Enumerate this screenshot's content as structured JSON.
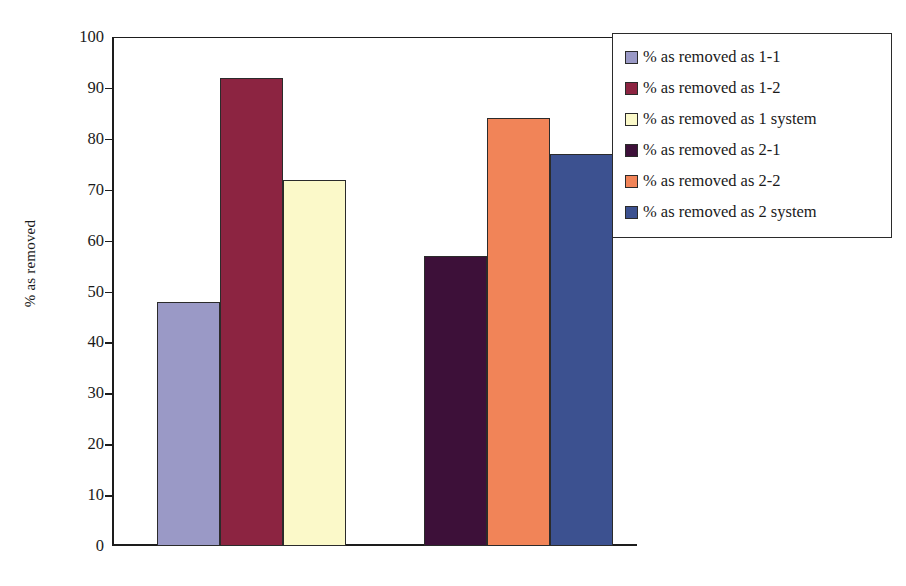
{
  "chart_data": {
    "type": "bar",
    "title": "",
    "xlabel": "",
    "ylabel": "% as removed",
    "ylim": [
      0,
      100
    ],
    "ytick_labels": [
      "100",
      "90",
      "80",
      "70",
      "60",
      "50",
      "40",
      "30",
      "20",
      "10",
      "0"
    ],
    "ytick_values": [
      100,
      90,
      80,
      70,
      60,
      50,
      40,
      30,
      20,
      10,
      0
    ],
    "grid": false,
    "legend_position": "right-top",
    "categories": [
      "System 1",
      "System 2"
    ],
    "series": [
      {
        "name": "% as removed as 1-1",
        "value": 48,
        "color": "#9a99c6",
        "group": 0
      },
      {
        "name": "% as removed as 1-2",
        "value": 92,
        "color": "#8c2441",
        "group": 0
      },
      {
        "name": "% as removed as 1 system",
        "value": 72,
        "color": "#fbf9c9",
        "group": 0
      },
      {
        "name": "% as removed as 2-1",
        "value": 57,
        "color": "#3d1039",
        "group": 1
      },
      {
        "name": "% as removed as 2-2",
        "value": 84,
        "color": "#f18458",
        "group": 1
      },
      {
        "name": "% as removed as 2 system",
        "value": 77,
        "color": "#3c5190",
        "group": 1
      }
    ]
  },
  "legend": {
    "entries": [
      {
        "label": "% as removed as 1-1",
        "color": "#9a99c6"
      },
      {
        "label": "% as removed as 1-2",
        "color": "#8c2441"
      },
      {
        "label": "% as removed as 1 system",
        "color": "#fbf9c9"
      },
      {
        "label": "% as removed as 2-1",
        "color": "#3d1039"
      },
      {
        "label": "% as removed as 2-2",
        "color": "#f18458"
      },
      {
        "label": "% as removed as 2 system",
        "color": "#3c5190"
      }
    ]
  }
}
